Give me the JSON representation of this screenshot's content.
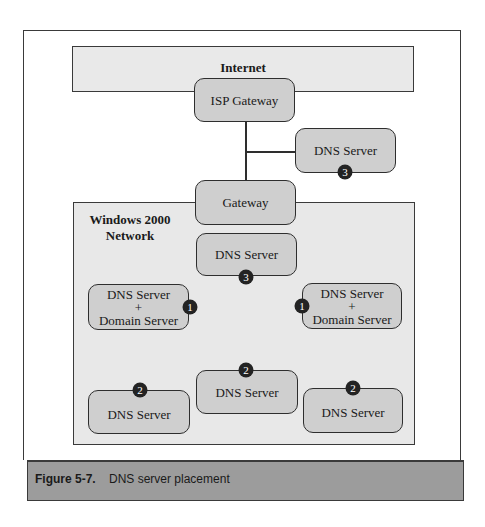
{
  "diagram": {
    "internet": {
      "label": "Internet"
    },
    "isp_gateway": {
      "label": "ISP Gateway"
    },
    "external_dns": {
      "label": "DNS Server",
      "badge": "3"
    },
    "gateway": {
      "label": "Gateway"
    },
    "network": {
      "label": "Windows 2000\nNetwork"
    },
    "central_dns": {
      "label": "DNS Server",
      "badge": "3"
    },
    "domain_left": {
      "label": "DNS Server\n+\nDomain Server",
      "badge": "1"
    },
    "domain_right": {
      "label": "DNS Server\n+\nDomain Server",
      "badge": "1"
    },
    "dns_bottom_left": {
      "label": "DNS Server",
      "badge": "2"
    },
    "dns_bottom_middle": {
      "label": "DNS Server",
      "badge": "2"
    },
    "dns_bottom_right": {
      "label": "DNS Server",
      "badge": "2"
    },
    "colors": {
      "node_fill": "#cfcfcf",
      "region_fill": "#e8e8e8",
      "badge_fill": "#232323",
      "caption_fill": "#9c9c9c"
    }
  },
  "caption": {
    "number": "Figure 5-7.",
    "text": "DNS server placement"
  }
}
